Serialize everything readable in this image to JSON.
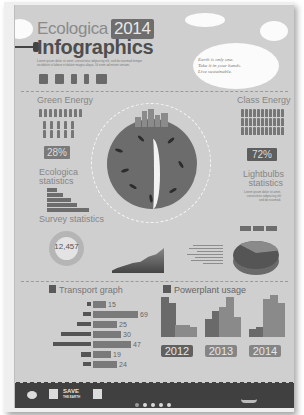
{
  "header": {
    "title_line1": "Ecologica",
    "year": "2014",
    "title_line2": "Infographics",
    "blurb": "Lorem ipsum dolor sit amet, consectetur adipiscing elit, sed do eiusmod tempor incididunt ut labore et dolore magna aliqua. Ut enim ad minim veniam.",
    "header_icons": [
      "factory-icon",
      "factory-icon",
      "solar-panel-icon",
      "wind-turbine-icon",
      "city-icon"
    ],
    "quote": [
      "Earth is only one.",
      "Take it in your hands.",
      "Live sustainable."
    ]
  },
  "green_energy": {
    "title": "Green Energy",
    "percent": "28%"
  },
  "class_energy": {
    "title": "Class Energy",
    "percent": "72%"
  },
  "ecologica_statistics": {
    "title_line1": "Ecologica",
    "title_line2": "statistics",
    "rows": [
      {
        "num": "15",
        "label": "Solar"
      },
      {
        "num": "25",
        "label": "Wind"
      },
      {
        "num": "40",
        "label": "Hydro"
      },
      {
        "num": "55",
        "label": "Bio"
      },
      {
        "num": "75",
        "label": "Geothermal"
      }
    ]
  },
  "lightbulbs": {
    "title_line1": "Lightbulbs",
    "title_line2": "statistics",
    "text": "Lorem ipsum dolor sit amet, consectetur adipiscing elit sed do eiusmod.",
    "labels": [
      "10%",
      "30%",
      "60%"
    ]
  },
  "survey": {
    "title": "Survey statistics",
    "count": "12,457",
    "count_label": "respondents"
  },
  "transport": {
    "title": "Transport graph",
    "rows": [
      {
        "icon": "bike-icon",
        "label": "Bike",
        "value": "15",
        "w": 15
      },
      {
        "icon": "car-icon",
        "label": "Car",
        "value": "69",
        "w": 69
      },
      {
        "icon": "bus-icon",
        "label": "Bus",
        "value": "25",
        "w": 25
      },
      {
        "icon": "train-icon",
        "label": "Train",
        "value": "30",
        "w": 30
      },
      {
        "icon": "subway-icon",
        "label": "Subway",
        "value": "47",
        "w": 47
      },
      {
        "icon": "ship-icon",
        "label": "Ship",
        "value": "19",
        "w": 19
      },
      {
        "icon": "airplane-icon",
        "label": "Airplane",
        "value": "24",
        "w": 24
      }
    ]
  },
  "powerplant": {
    "title": "Powerplant usage",
    "groups": [
      {
        "year": "2012",
        "bars": [
          40,
          34,
          12,
          12,
          10
        ]
      },
      {
        "year": "2013",
        "bars": [
          18,
          26,
          30,
          40,
          20
        ]
      },
      {
        "year": "2014",
        "bars": [
          8,
          10,
          38,
          42,
          34
        ]
      }
    ]
  },
  "footer": {
    "save_line1": "SAVE",
    "save_line2": "THE EARTH",
    "logos": [
      "recycle-logo",
      "grid-logo",
      "save-earth-logo",
      "eco-logo"
    ],
    "dots": 5
  }
}
